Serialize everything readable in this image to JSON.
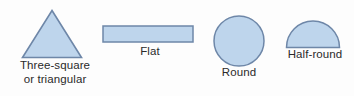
{
  "diagram": {
    "background_color": "#fdfdfd",
    "shape_fill_color": "#bed5ec",
    "shape_stroke_color": "#6e87a8",
    "text_color": "#2a2a2a",
    "figures": [
      {
        "id": "triangle",
        "shape": "triangle-icon",
        "label_line1": "Three-square",
        "label_line2": "or triangular"
      },
      {
        "id": "flat",
        "shape": "rectangle-icon",
        "label_line1": "Flat",
        "label_line2": ""
      },
      {
        "id": "round",
        "shape": "circle-icon",
        "label_line1": "Round",
        "label_line2": ""
      },
      {
        "id": "half-round",
        "shape": "semicircle-icon",
        "label_line1": "Half-round",
        "label_line2": ""
      }
    ]
  }
}
